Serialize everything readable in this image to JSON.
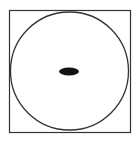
{
  "diagram": {
    "colors": {
      "stroke": "#333333",
      "fill": "#111111",
      "background": "#ffffff"
    },
    "shapes": {
      "square": {
        "x": 9,
        "y": 10,
        "width": 121,
        "height": 123
      },
      "circle": {
        "cx": 69.5,
        "cy": 71,
        "r": 59
      },
      "ellipse": {
        "cx": 69,
        "cy": 71,
        "rx": 10,
        "ry": 4
      }
    }
  }
}
